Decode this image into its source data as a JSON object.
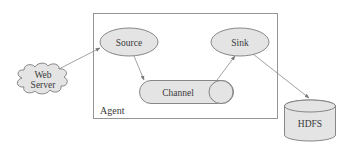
{
  "diagram": {
    "type": "architecture",
    "container": {
      "label": "Agent"
    },
    "nodes": [
      {
        "id": "web_server",
        "label_line1": "Web",
        "label_line2": "Server",
        "shape": "cloud"
      },
      {
        "id": "source",
        "label": "Source",
        "shape": "ellipse"
      },
      {
        "id": "channel",
        "label": "Channel",
        "shape": "pipe"
      },
      {
        "id": "sink",
        "label": "Sink",
        "shape": "ellipse"
      },
      {
        "id": "hdfs",
        "label": "HDFS",
        "shape": "cylinder"
      }
    ],
    "edges": [
      {
        "from": "web_server",
        "to": "source"
      },
      {
        "from": "source",
        "to": "channel"
      },
      {
        "from": "channel",
        "to": "sink"
      },
      {
        "from": "sink",
        "to": "hdfs"
      }
    ],
    "colors": {
      "fill": "#e4e4e4",
      "stroke": "#7a7a7a",
      "text": "#3a3a3a",
      "background": "#ffffff"
    }
  }
}
